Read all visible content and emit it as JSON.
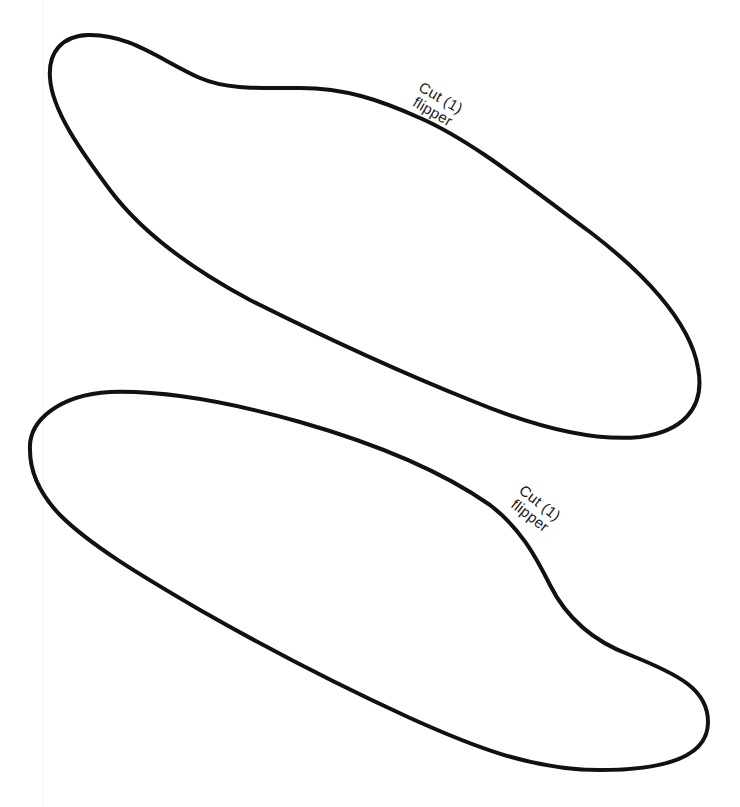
{
  "document": {
    "type": "cut-out template",
    "stroke_color": "#111111",
    "background_color": "#ffffff"
  },
  "pieces": [
    {
      "id": "flipper-top",
      "label_line1": "Cut (1)",
      "label_line2": "flipper"
    },
    {
      "id": "flipper-bottom",
      "label_line1": "Cut (1)",
      "label_line2": "flipper"
    }
  ]
}
